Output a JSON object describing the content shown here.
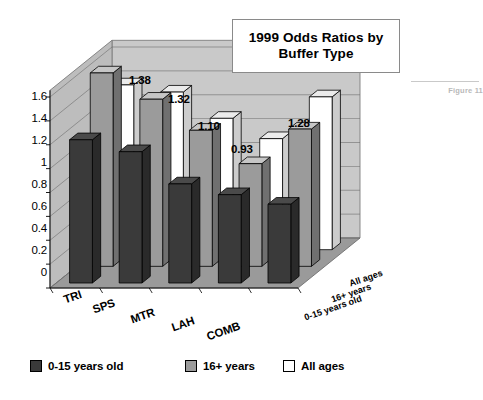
{
  "figure": {
    "title_lines": [
      "1999 Odds Ratios by",
      "Buffer Type"
    ],
    "caption": "Figure 11"
  },
  "legend": {
    "position": "bottom",
    "items": [
      {
        "label": "0-15 years old",
        "color": "#3a3a3a"
      },
      {
        "label": "16+ years",
        "color": "#9b9b9b"
      },
      {
        "label": "All ages",
        "color": "#ffffff"
      }
    ]
  },
  "colors": {
    "series_dark": "#3a3a3a",
    "series_gray": "#9b9b9b",
    "series_white": "#ffffff",
    "wall_back": "#c9c9c9",
    "wall_side": "#bdbdbd",
    "floor": "#9a9a9a",
    "gridline": "#6f6f6f",
    "outline": "#000000",
    "caption_text": "#b9b9b9"
  },
  "chart_data": {
    "type": "bar",
    "title": "1999 Odds Ratios by Buffer Type",
    "xlabel": "",
    "ylabel": "",
    "ylim": [
      0,
      1.6
    ],
    "yticks": [
      "0",
      "0.2",
      "0.4",
      "0.6",
      "0.8",
      "1",
      "1.2",
      "1.4",
      "1.6"
    ],
    "ytick_values": [
      0,
      0.2,
      0.4,
      0.6,
      0.8,
      1.0,
      1.2,
      1.4,
      1.6
    ],
    "grid": true,
    "threed": true,
    "categories": [
      "TRI",
      "SPS",
      "MTR",
      "LAH",
      "COMB"
    ],
    "depth_labels": [
      "0-15 years old",
      "16+ years",
      "All ages"
    ],
    "series": [
      {
        "name": "0-15 years old",
        "color": "#3a3a3a",
        "values": [
          1.2,
          1.1,
          0.83,
          0.74,
          0.66
        ]
      },
      {
        "name": "16+ years",
        "color": "#9b9b9b",
        "values": [
          1.62,
          1.4,
          1.14,
          0.86,
          1.15
        ]
      },
      {
        "name": "All ages",
        "color": "#ffffff",
        "values": [
          1.38,
          1.32,
          1.1,
          0.93,
          1.28
        ]
      }
    ],
    "data_labels": {
      "series": "All ages",
      "values": [
        "1.38",
        "1.32",
        "1.10",
        "0.93",
        "1.28"
      ]
    }
  },
  "ylabels": [
    {
      "text": "1.6",
      "x": 17,
      "y": 90
    },
    {
      "text": "1.4",
      "x": 17,
      "y": 112
    },
    {
      "text": "1.2",
      "x": 17,
      "y": 134
    },
    {
      "text": "1",
      "x": 17,
      "y": 156
    },
    {
      "text": "0.8",
      "x": 17,
      "y": 178
    },
    {
      "text": "0.6",
      "x": 17,
      "y": 200
    },
    {
      "text": "0.4",
      "x": 17,
      "y": 222
    },
    {
      "text": "0.2",
      "x": 17,
      "y": 244
    },
    {
      "text": "0",
      "x": 17,
      "y": 266
    }
  ],
  "data_label_pos": [
    {
      "text": "1.38",
      "x": 129,
      "y": 74
    },
    {
      "text": "1.32",
      "x": 168,
      "y": 93
    },
    {
      "text": "1.10",
      "x": 198,
      "y": 120
    },
    {
      "text": "0.93",
      "x": 231,
      "y": 143
    },
    {
      "text": "1.28",
      "x": 288,
      "y": 117
    }
  ],
  "category_label_pos": [
    {
      "text": "TRI",
      "x": 62,
      "y": 294,
      "rot": -19
    },
    {
      "text": "SPS",
      "x": 91,
      "y": 304,
      "rot": -19
    },
    {
      "text": "MTR",
      "x": 129,
      "y": 314,
      "rot": -19
    },
    {
      "text": "LAH",
      "x": 170,
      "y": 322,
      "rot": -19
    },
    {
      "text": "COMB",
      "x": 205,
      "y": 331,
      "rot": -19
    }
  ],
  "series_label_pos": [
    {
      "text": "All ages",
      "x": 348,
      "y": 279,
      "rot": -19
    },
    {
      "text": "16+ years",
      "x": 330,
      "y": 295,
      "rot": -19
    },
    {
      "text": "0-15 years old",
      "x": 303,
      "y": 313,
      "rot": -19
    }
  ],
  "legend_pos": [
    {
      "x": 0,
      "y": 0
    },
    {
      "x": 155,
      "y": 0
    },
    {
      "x": 253,
      "y": 0
    }
  ]
}
